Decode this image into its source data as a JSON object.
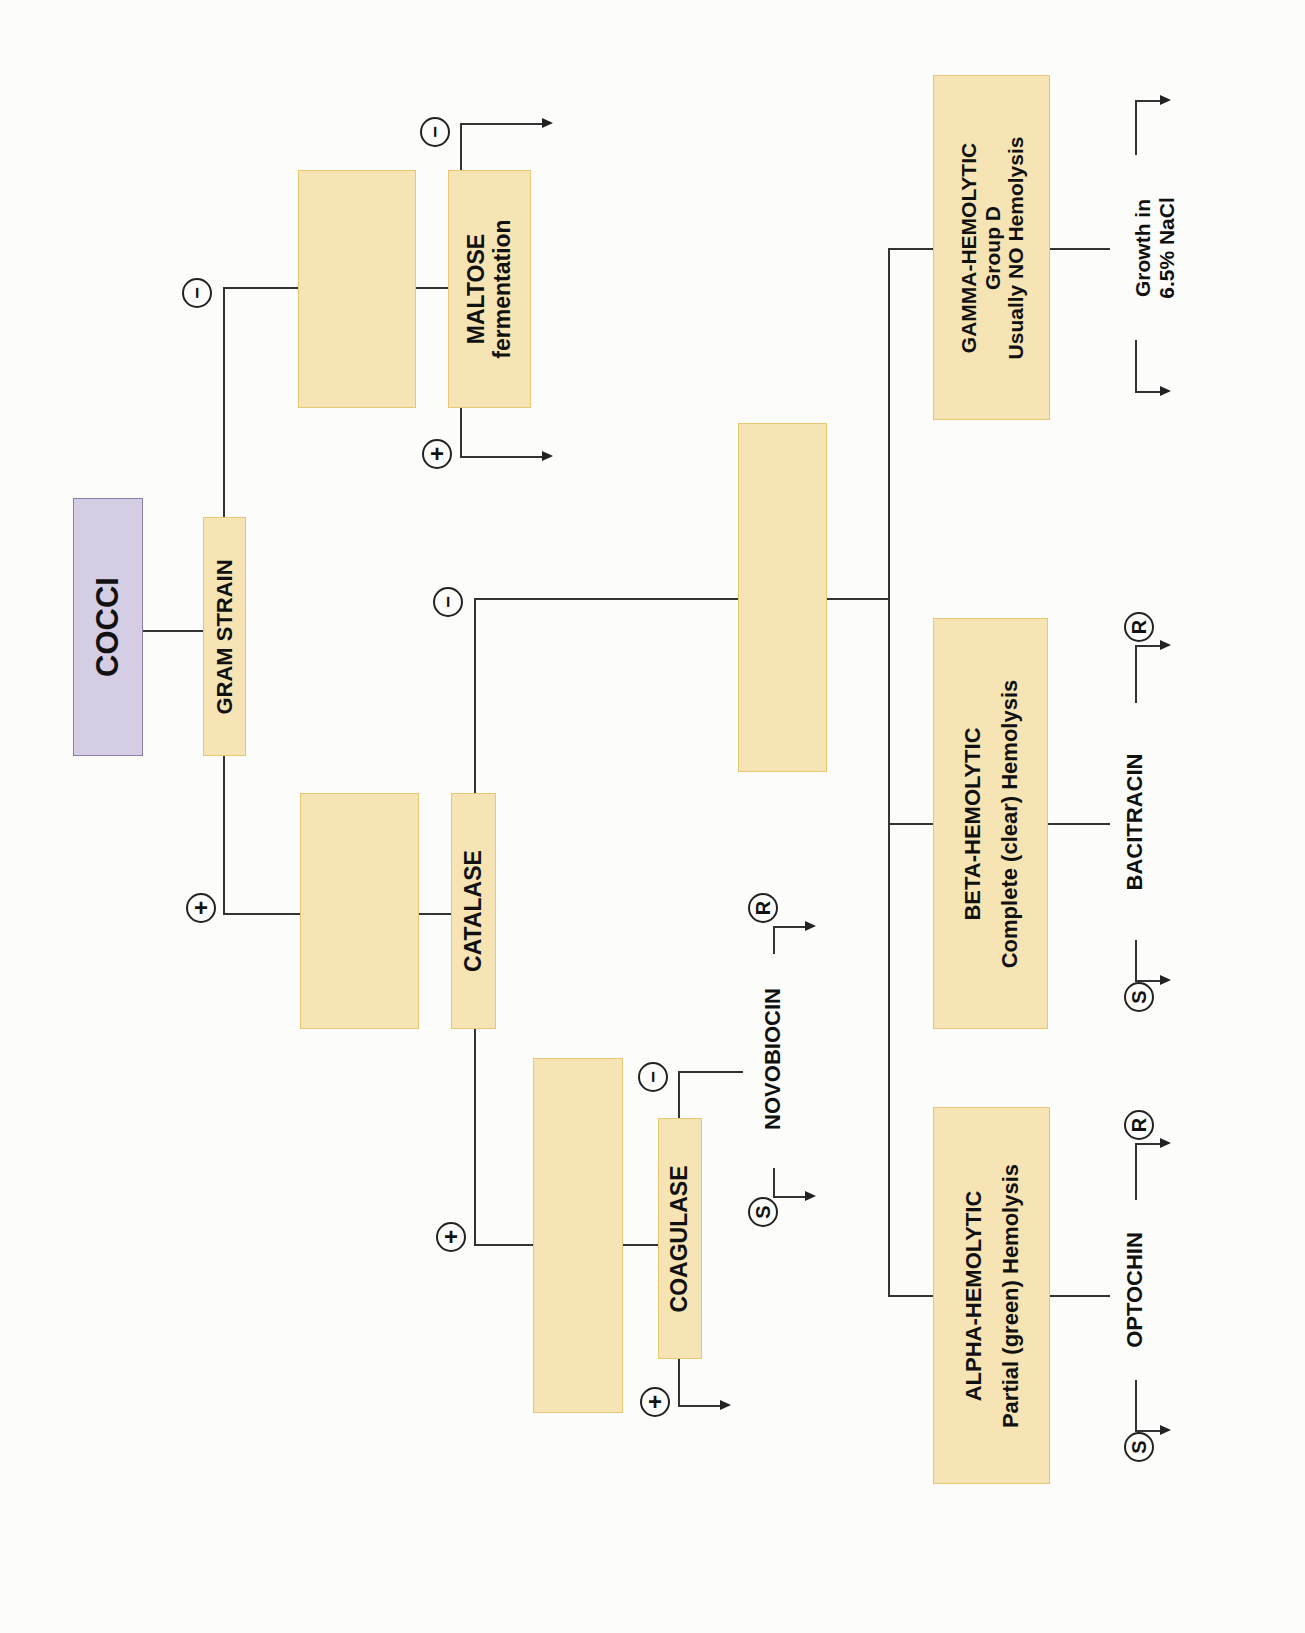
{
  "diagram": {
    "orientation": "rotated 90 degrees counter-clockwise",
    "colors": {
      "root_fill": "#d5cde3",
      "root_border": "#8d7fa8",
      "node_fill": "#f6e4b4",
      "node_border": "#e8c774",
      "line": "#333333"
    },
    "root": {
      "label": "COCCI"
    },
    "tests": {
      "gram": {
        "label": "GRAM STRAIN"
      },
      "maltose": {
        "line1": "MALTOSE",
        "line2": "fermentation"
      },
      "catalase": {
        "label": "CATALASE"
      },
      "coagulase": {
        "label": "COAGULASE"
      },
      "novobiocin": {
        "label": "NOVOBIOCIN"
      },
      "optochin": {
        "label": "OPTOCHIN"
      },
      "bacitracin": {
        "label": "BACITRACIN"
      },
      "nacl": {
        "line1": "Growth in",
        "line2": "6.5% NaCl"
      }
    },
    "hemolysis": {
      "alpha": {
        "line1": "ALPHA-HEMOLYTIC",
        "line2": "Partial (green) Hemolysis"
      },
      "beta": {
        "line1": "BETA-HEMOLYTIC",
        "line2": "Complete (clear) Hemolysis"
      },
      "gamma": {
        "line1": "GAMMA-HEMOLYTIC",
        "line2": "Group D",
        "line3": "Usually NO Hemolysis"
      }
    },
    "blank_boxes": [
      "gram-negative-result",
      "gram-positive-result",
      "coagulase-result",
      "catalase-negative-result"
    ],
    "signs": {
      "plus": "+",
      "minus": "−",
      "sensitive": "S",
      "resistant": "R"
    }
  }
}
